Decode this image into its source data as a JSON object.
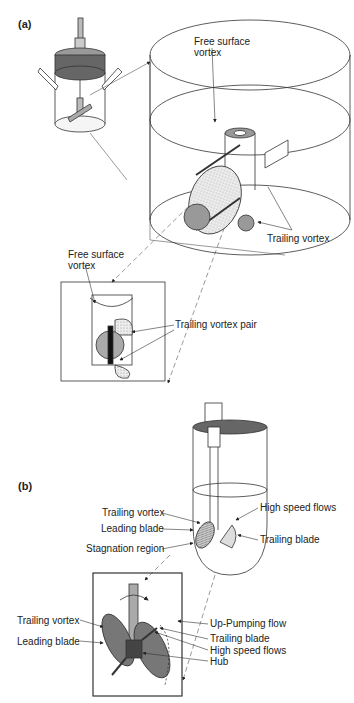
{
  "panels": {
    "a": {
      "label": "(a)",
      "annotations": {
        "free_surface_vortex_top": "Free surface\nvortex",
        "free_surface_vortex_top_l1": "Free surface",
        "free_surface_vortex_top_l2": "vortex",
        "trailing_vortex": "Trailing vortex",
        "free_surface_vortex_inset_l1": "Free surface",
        "free_surface_vortex_inset_l2": "vortex",
        "trailing_vortex_pair": "Trailing vortex pair"
      }
    },
    "b": {
      "label": "(b)",
      "annotations": {
        "trailing_vortex": "Trailing vortex",
        "leading_blade": "Leading blade",
        "stagnation_region": "Stagnation region",
        "high_speed_flows": "High speed flows",
        "trailing_blade": "Trailing blade"
      },
      "inset_annotations": {
        "trailing_vortex": "Trailing vortex",
        "leading_blade": "Leading blade",
        "up_pumping_flow": "Up-Pumping flow",
        "trailing_blade": "Trailing blade",
        "high_speed_flows": "High speed flows",
        "hub": "Hub"
      }
    }
  },
  "colors": {
    "line": "#333333",
    "fill_gray": "#a0a0a0",
    "fill_dark": "#555555",
    "fill_light": "#d8d8d8"
  }
}
